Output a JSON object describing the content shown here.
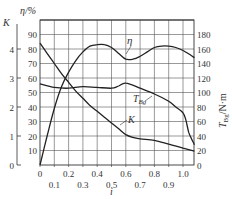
{
  "chart_data": {
    "type": "line",
    "title": "",
    "xlabel": "i",
    "ylabel_left_eta": "η/%",
    "ylabel_left_k": "K",
    "ylabel_right": "T_Bg/N·m",
    "xlim": [
      0,
      1.08
    ],
    "x_ticks_upper": [
      "0",
      "0.2",
      "0.4",
      "0.6",
      "0.8",
      "1.0"
    ],
    "x_ticks_lower": [
      "0.1",
      "0.3",
      "0.5",
      "0.7",
      "0.9"
    ],
    "eta_ticks": [
      "10",
      "20",
      "30",
      "40",
      "50",
      "60",
      "70",
      "80",
      "90"
    ],
    "k_ticks": [
      "0",
      "1",
      "2",
      "3",
      "4"
    ],
    "torque_ticks": [
      "0",
      "20",
      "40",
      "60",
      "80",
      "100",
      "120",
      "140",
      "160",
      "180"
    ],
    "grid": true,
    "series": [
      {
        "name": "η",
        "axis": "eta",
        "x": [
          0,
          0.05,
          0.1,
          0.15,
          0.2,
          0.25,
          0.3,
          0.35,
          0.4,
          0.45,
          0.5,
          0.55,
          0.6,
          0.65,
          0.7,
          0.75,
          0.8,
          0.85,
          0.9,
          0.95,
          1.0,
          1.05,
          1.08
        ],
        "values": [
          0,
          20,
          39,
          54,
          64,
          72,
          78,
          82,
          83,
          83,
          81,
          77,
          73,
          73,
          75,
          78,
          81,
          82,
          82,
          81,
          79,
          76,
          74
        ]
      },
      {
        "name": "K",
        "axis": "k",
        "x": [
          0,
          0.05,
          0.1,
          0.15,
          0.2,
          0.25,
          0.3,
          0.35,
          0.4,
          0.45,
          0.5,
          0.55,
          0.6,
          0.65,
          0.7,
          0.8,
          0.9,
          1.0,
          1.08
        ],
        "values": [
          4.2,
          3.85,
          3.5,
          3.15,
          2.85,
          2.55,
          2.3,
          2.05,
          1.85,
          1.65,
          1.45,
          1.25,
          1.05,
          0.95,
          0.9,
          0.85,
          0.72,
          0.58,
          0.48
        ]
      },
      {
        "name": "T_Bg",
        "axis": "torque",
        "x": [
          0,
          0.1,
          0.2,
          0.3,
          0.4,
          0.5,
          0.55,
          0.6,
          0.7,
          0.8,
          0.9,
          0.95,
          1.0,
          1.02,
          1.04,
          1.06,
          1.08
        ],
        "values": [
          112,
          107,
          106,
          108,
          107,
          106,
          109,
          113,
          106,
          98,
          88,
          80,
          72,
          62,
          45,
          36,
          28
        ]
      }
    ],
    "annotations": [
      {
        "text": "η",
        "near_series": "η"
      },
      {
        "text": "T_Bg",
        "near_series": "T_Bg"
      },
      {
        "text": "K",
        "near_series": "K"
      }
    ]
  },
  "labels": {
    "eta_axis": "η/%",
    "k_axis": "K",
    "right_axis_t": "T",
    "right_axis_sub": "Bg",
    "right_axis_unit": "/N·m",
    "x_axis": "i",
    "eta_curve": "η",
    "t_curve": "T",
    "t_curve_sub": "Bg",
    "k_curve": "K"
  }
}
